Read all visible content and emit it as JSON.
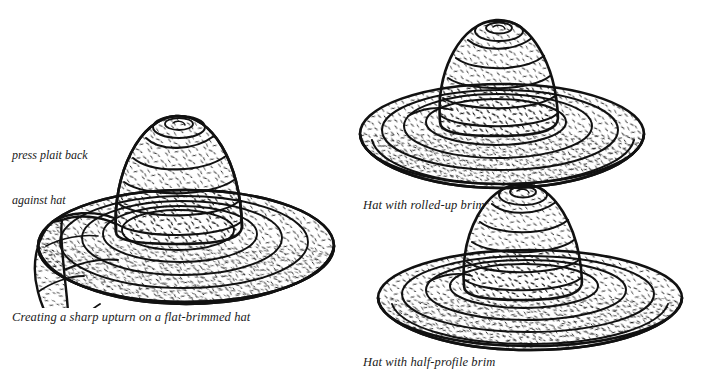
{
  "page": {
    "kind": "line-illustration",
    "background_color": "#ffffff",
    "ink_color": "#111111"
  },
  "annotations": [
    {
      "id": "press-plait",
      "name": "annotation-press-plait",
      "line1": "press plait back",
      "line2": "against hat"
    }
  ],
  "figures": [
    {
      "id": "flat-brim",
      "name": "figure-flat-brim",
      "caption": "Creating a sharp upturn on a flat-brimmed hat",
      "crown_rings": 6,
      "brim_rings": 5
    },
    {
      "id": "rolled-brim",
      "name": "figure-rolled-brim",
      "caption": "Hat with rolled-up brim",
      "crown_rings": 6,
      "brim_rings": 4
    },
    {
      "id": "half-brim",
      "name": "figure-half-brim",
      "caption": "Hat with half-profile brim",
      "crown_rings": 6,
      "brim_rings": 4
    }
  ],
  "captions": {
    "flat_brim": "Creating a sharp upturn on a flat-brimmed hat",
    "rolled_brim": "Hat with rolled-up brim",
    "half_brim": "Hat with half-profile brim"
  }
}
